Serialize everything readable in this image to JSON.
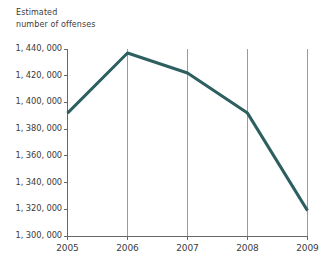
{
  "chart_data": {
    "type": "line",
    "title": "Estimated\nnumber of offenses",
    "xlabel": "",
    "ylabel": "",
    "categories": [
      "2005",
      "2006",
      "2007",
      "2008",
      "2009"
    ],
    "x": [
      2005,
      2006,
      2007,
      2008,
      2009
    ],
    "values": [
      1392000,
      1437000,
      1422000,
      1392000,
      1319000
    ],
    "series": [
      {
        "name": "Estimated number of offenses",
        "values": [
          1392000,
          1437000,
          1422000,
          1392000,
          1319000
        ]
      }
    ],
    "ylim": [
      1300000,
      1440000
    ],
    "ytick_values": [
      1440000,
      1420000,
      1400000,
      1380000,
      1360000,
      1340000,
      1320000,
      1300000
    ],
    "ytick_labels": [
      "1, 440, 000",
      "1, 420, 000",
      "1, 400, 000",
      "1, 380, 000",
      "1, 360, 000",
      "1, 340, 000",
      "1, 320, 000",
      "1, 300, 000"
    ],
    "xtick_labels": [
      "2005",
      "2006",
      "2007",
      "2008",
      "2009"
    ],
    "grid": "vertical-only",
    "gridline_categories": [
      "2006",
      "2007",
      "2008",
      "2009"
    ],
    "legend": "none",
    "line_color": "#2e5f60",
    "grid_color": "#9a9a9a",
    "axis_color": "#666666",
    "text_color": "#3c3c3c",
    "background_color": "#ffffff"
  }
}
